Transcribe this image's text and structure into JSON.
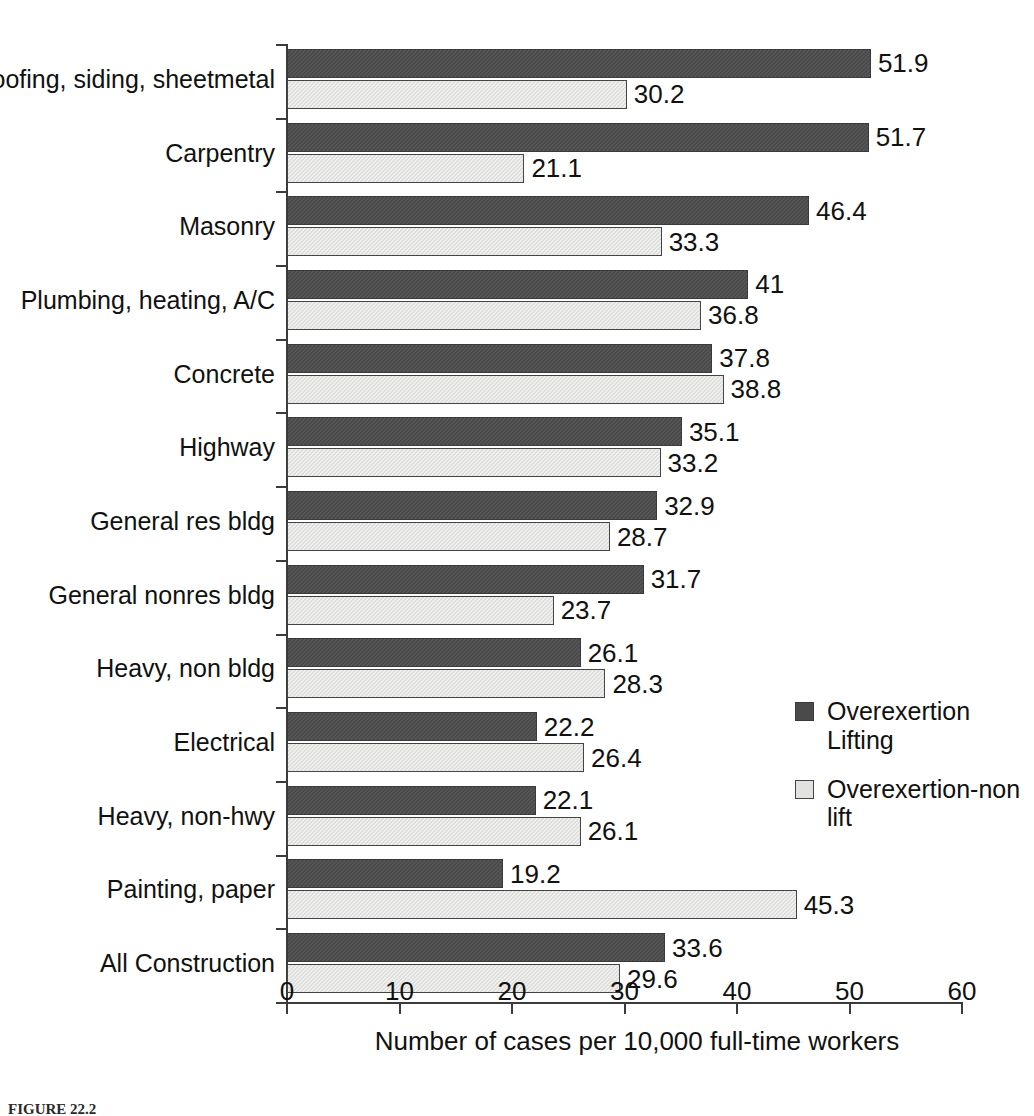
{
  "chart_data": {
    "type": "bar",
    "orientation": "horizontal",
    "title": "",
    "xlabel": "Number of cases per 10,000 full-time workers",
    "ylabel": "",
    "xlim": [
      0,
      60
    ],
    "xticks": [
      "0",
      "10",
      "20",
      "30",
      "40",
      "50",
      "60"
    ],
    "grid": false,
    "legend_position": "right-middle",
    "categories": [
      "Roofing, siding, sheetmetal",
      "Carpentry",
      "Masonry",
      "Plumbing, heating, A/C",
      "Concrete",
      "Highway",
      "General res bldg",
      "General nonres bldg",
      "Heavy, non bldg",
      "Electrical",
      "Heavy, non-hwy",
      "Painting, paper",
      "All Construction"
    ],
    "series": [
      {
        "name": "Overexertion Lifting",
        "color": "#4a4a4a",
        "values": [
          51.9,
          51.7,
          46.4,
          41,
          37.8,
          35.1,
          32.9,
          31.7,
          26.1,
          22.2,
          22.1,
          19.2,
          33.6
        ],
        "labels": [
          "51.9",
          "51.7",
          "46.4",
          "41",
          "37.8",
          "35.1",
          "32.9",
          "31.7",
          "26.1",
          "22.2",
          "22.1",
          "19.2",
          "33.6"
        ]
      },
      {
        "name": "Overexertion-non lift",
        "color": "#dededc",
        "values": [
          30.2,
          21.1,
          33.3,
          36.8,
          38.8,
          33.2,
          28.7,
          23.7,
          28.3,
          26.4,
          26.1,
          45.3,
          29.6
        ],
        "labels": [
          "30.2",
          "21.1",
          "33.3",
          "36.8",
          "38.8",
          "33.2",
          "28.7",
          "23.7",
          "28.3",
          "26.4",
          "26.1",
          "45.3",
          "29.6"
        ]
      }
    ]
  },
  "legend": {
    "entries": [
      {
        "label": "Overexertion Lifting",
        "swatch": "dark"
      },
      {
        "label": "Overexertion-non lift",
        "swatch": "light"
      }
    ]
  },
  "axis": {
    "x_title": "Number of cases per 10,000 full-time workers"
  },
  "caption": {
    "figure_number": "FIGURE 22.2",
    "text": ""
  }
}
